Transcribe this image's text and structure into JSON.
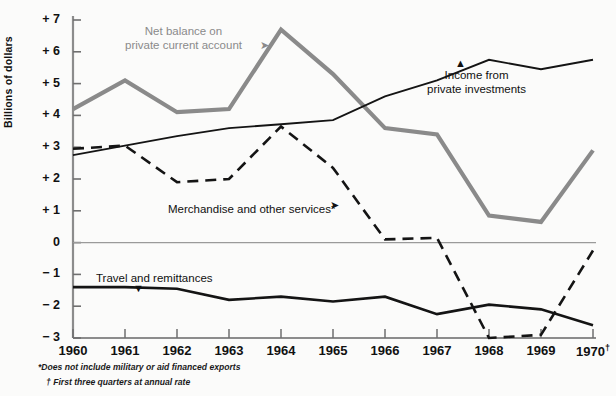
{
  "chart_data": {
    "type": "line",
    "title": "",
    "xlabel": "",
    "ylabel": "Billions of dollars",
    "xlim": [
      1960,
      1970
    ],
    "ylim": [
      -3,
      7
    ],
    "grid": false,
    "legend": "inline-annotations",
    "x": [
      1960,
      1961,
      1962,
      1963,
      1964,
      1965,
      1966,
      1967,
      1968,
      1969,
      1970
    ],
    "xticklabels": [
      "1960",
      "1961",
      "1962",
      "1963",
      "1964",
      "1965",
      "1966",
      "1967",
      "1968",
      "1969",
      "1970†"
    ],
    "yticklabels": [
      "+ 7",
      "+ 6",
      "+ 5",
      "+ 4",
      "+ 3",
      "+ 2",
      "+ 1",
      "0",
      "− 1",
      "− 2",
      "− 3"
    ],
    "yticks": [
      7,
      6,
      5,
      4,
      3,
      2,
      1,
      0,
      -1,
      -2,
      -3
    ],
    "zero_line": 0,
    "series": [
      {
        "name": "Net balance on private current account",
        "style": "solid-thick-grey",
        "color": "#8a8a8a",
        "values": [
          4.2,
          5.1,
          4.1,
          4.2,
          6.7,
          5.3,
          3.6,
          3.4,
          0.85,
          0.65,
          2.9
        ]
      },
      {
        "name": "Income from private investments",
        "style": "solid-thin-black",
        "color": "#141414",
        "values": [
          2.75,
          3.05,
          3.35,
          3.6,
          3.72,
          3.85,
          4.6,
          5.0,
          5.15,
          4.8,
          5.1
        ],
        "display_values": [
          2.75,
          3.05,
          3.35,
          3.6,
          3.72,
          3.85,
          4.6,
          5.1,
          5.75,
          5.45,
          5.75
        ]
      },
      {
        "name": "Merchandise and other services*",
        "style": "dashed-black",
        "color": "#141414",
        "values": [
          2.95,
          3.05,
          1.9,
          2.0,
          3.65,
          2.35,
          0.1,
          0.15,
          -3.0,
          -2.9,
          -0.25
        ]
      },
      {
        "name": "Travel and remittances",
        "style": "solid-medium-black",
        "color": "#141414",
        "values": [
          -1.4,
          -1.4,
          -1.45,
          -1.8,
          -1.7,
          -1.85,
          -1.7,
          -2.0,
          -2.3,
          -2.2,
          -1.85
        ],
        "display_values": [
          -1.4,
          -1.4,
          -1.45,
          -1.8,
          -1.7,
          -1.85,
          -1.7,
          -2.25,
          -1.95,
          -2.1,
          -2.6
        ]
      }
    ],
    "annotations": [
      {
        "id": "net-balance",
        "text_line1": "Net balance on",
        "text_line2": "private current account",
        "color": "#8a8a8a"
      },
      {
        "id": "income",
        "text_line1": "Income from",
        "text_line2": "private investments",
        "color": "#141414"
      },
      {
        "id": "merchandise",
        "text_line1": "Merchandise and other services*",
        "text_line2": "",
        "color": "#141414"
      },
      {
        "id": "travel",
        "text_line1": "Travel and remittances",
        "text_line2": "",
        "color": "#141414"
      }
    ],
    "footnotes": [
      "*Does not include military or aid financed exports",
      "† First three quarters at annual rate"
    ]
  }
}
